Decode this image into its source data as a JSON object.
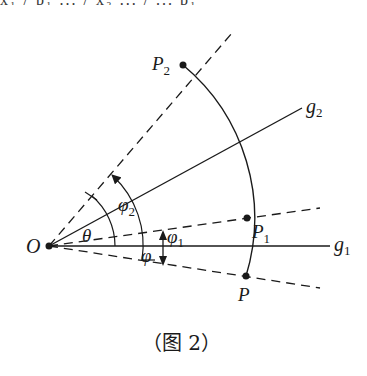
{
  "header_cropped_text": "x₁ / p₁ ... / x₂ ... / ... p₁",
  "diagram": {
    "labels": {
      "origin": "O",
      "theta": "θ",
      "phi": "φ",
      "phi1_base": "φ",
      "phi1_sub": "1",
      "phi2_base": "φ",
      "phi2_sub": "2",
      "P": "P",
      "P1_base": "P",
      "P1_sub": "1",
      "P2_base": "P",
      "P2_sub": "2",
      "g1_base": "g",
      "g1_sub": "1",
      "g2_base": "g",
      "g2_sub": "2"
    },
    "caption": "（图 2）",
    "colors": {
      "stroke": "#1a1a1a",
      "background": "#ffffff"
    },
    "points": {
      "O": [
        49,
        246
      ],
      "P": [
        246,
        276
      ],
      "P1": [
        247,
        218
      ],
      "P2": [
        183,
        65
      ]
    }
  }
}
